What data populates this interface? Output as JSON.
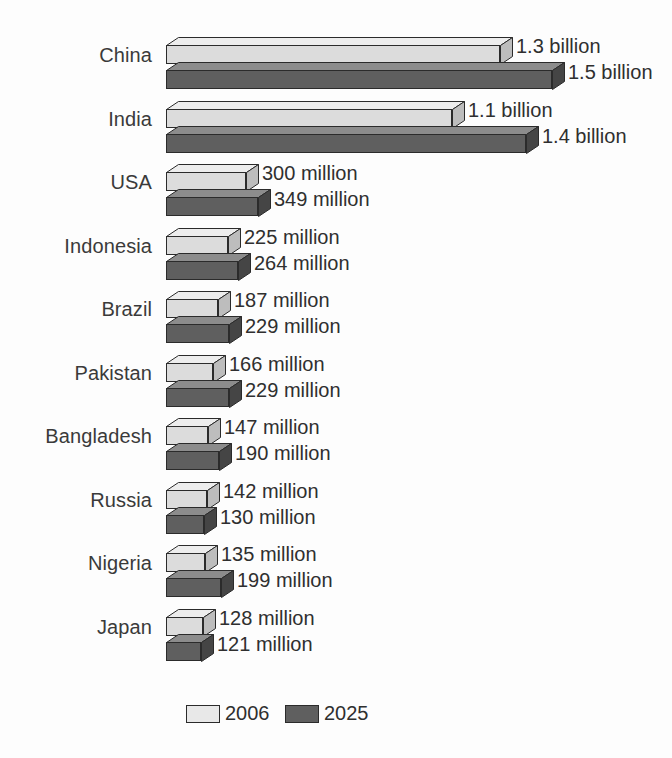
{
  "chart_data": {
    "type": "bar",
    "orientation": "horizontal",
    "style": "3d-bars",
    "title": "",
    "xlabel": "",
    "ylabel": "",
    "categories": [
      "China",
      "India",
      "USA",
      "Indonesia",
      "Brazil",
      "Pakistan",
      "Bangladesh",
      "Russia",
      "Nigeria",
      "Japan"
    ],
    "series": [
      {
        "name": "2006",
        "color": "#dcdcdc",
        "values": [
          1300,
          1100,
          300,
          225,
          187,
          166,
          147,
          142,
          135,
          128
        ],
        "labels": [
          "1.3 billion",
          "1.1 billion",
          "300 million",
          "225 million",
          "187 million",
          "166 million",
          "147 million",
          "142 million",
          "135 million",
          "128 million"
        ]
      },
      {
        "name": "2025",
        "color": "#5f5f5f",
        "values": [
          1500,
          1400,
          349,
          264,
          229,
          229,
          190,
          130,
          199,
          121
        ],
        "labels": [
          "1.5 billion",
          "1.4 billion",
          "349 million",
          "264 million",
          "229 million",
          "229 million",
          "190 million",
          "130 million",
          "199 million",
          "121 million"
        ]
      }
    ],
    "unit": "millions of people",
    "xlim": [
      0,
      1500
    ],
    "grid": false,
    "legend_position": "bottom"
  },
  "rows": [
    {
      "category": "China",
      "light_label": "1.3 billion",
      "dark_label": "1.5 billion",
      "light_width": 334,
      "dark_width": 386
    },
    {
      "category": "India",
      "light_label": "1.1 billion",
      "dark_label": "1.4 billion",
      "light_width": 286,
      "dark_width": 360
    },
    {
      "category": "USA",
      "light_label": "300 million",
      "dark_label": "349 million",
      "light_width": 80,
      "dark_width": 92
    },
    {
      "category": "Indonesia",
      "light_label": "225 million",
      "dark_label": "264 million",
      "light_width": 62,
      "dark_width": 72
    },
    {
      "category": "Brazil",
      "light_label": "187 million",
      "dark_label": "229 million",
      "light_width": 52,
      "dark_width": 63
    },
    {
      "category": "Pakistan",
      "light_label": "166 million",
      "dark_label": "229 million",
      "light_width": 47,
      "dark_width": 63
    },
    {
      "category": "Bangladesh",
      "light_label": "147 million",
      "dark_label": "190 million",
      "light_width": 42,
      "dark_width": 53
    },
    {
      "category": "Russia",
      "light_label": "142 million",
      "dark_label": "130 million",
      "light_width": 41,
      "dark_width": 38
    },
    {
      "category": "Nigeria",
      "light_label": "135 million",
      "dark_label": "199 million",
      "light_width": 39,
      "dark_width": 55
    },
    {
      "category": "Japan",
      "light_label": "128 million",
      "dark_label": "121 million",
      "light_width": 37,
      "dark_width": 35
    }
  ],
  "legend": {
    "items": [
      {
        "label": "2006",
        "swatch": "light"
      },
      {
        "label": "2025",
        "swatch": "dark"
      }
    ]
  },
  "colors": {
    "light_front": "#dcdcdc",
    "light_top": "#ededed",
    "light_side": "#bdbdbd",
    "dark_front": "#5f5f5f",
    "dark_top": "#8c8c8c",
    "dark_side": "#454545",
    "outline": "#2b2b2b",
    "text": "#2f2f2f",
    "background": "#fdfdfd"
  }
}
